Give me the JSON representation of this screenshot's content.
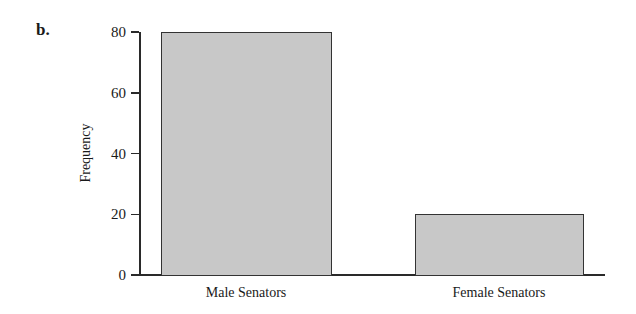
{
  "panel_label": "b.",
  "chart_data": {
    "type": "bar",
    "title": "",
    "xlabel": "",
    "ylabel": "Frequency",
    "categories": [
      "Male Senators",
      "Female Senators"
    ],
    "values": [
      80,
      20
    ],
    "ylim": [
      0,
      80
    ],
    "yticks": [
      0,
      20,
      40,
      60,
      80
    ],
    "grid": false,
    "legend": null,
    "bar_color": "#c8c8c8",
    "edge_color": "#333333"
  }
}
